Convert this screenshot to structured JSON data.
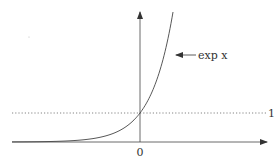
{
  "chart_data": {
    "type": "line",
    "title": "",
    "xlabel": "",
    "ylabel": "",
    "series": [
      {
        "name": "exp x",
        "function": "exp(x)"
      }
    ],
    "annotations": [
      {
        "text": "exp x",
        "points_to": "curve"
      },
      {
        "text": "1",
        "type": "horizontal-dotted-line",
        "y": 1
      }
    ],
    "x_tick_labels": [
      "0"
    ],
    "y_reference_labels": [
      "1"
    ],
    "grid": false,
    "legend": "none"
  },
  "labels": {
    "curve": "exp x",
    "one": "1",
    "origin": "0"
  },
  "colors": {
    "ink": "#333333"
  }
}
